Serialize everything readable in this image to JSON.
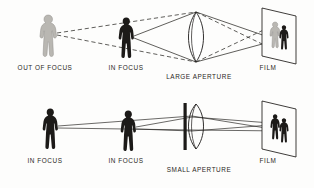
{
  "figure": {
    "background_color": "#fdfdfc",
    "ink_color": "#1c1a18",
    "blur_color": "#b9b7b2"
  },
  "panels": [
    {
      "id": "large-aperture",
      "aperture_type": "large",
      "subject_labels": [
        {
          "id": "out-of-focus",
          "text": "OUT OF FOCUS",
          "x": 45,
          "y": 70
        },
        {
          "id": "in-focus",
          "text": "IN FOCUS",
          "x": 126,
          "y": 70
        }
      ],
      "aperture_label": {
        "id": "large-aperture",
        "text": "LARGE APERTURE",
        "x": 199,
        "y": 79
      },
      "film_label": {
        "id": "film",
        "text": "FILM",
        "x": 268,
        "y": 70
      },
      "subjects": [
        {
          "id": "subject-out-of-focus",
          "state": "blurred",
          "color": "#b9b7b2",
          "x": 48,
          "y": 36
        },
        {
          "id": "subject-in-focus",
          "state": "sharp",
          "color": "#1c1a18",
          "x": 126,
          "y": 36
        }
      ],
      "film_image": [
        {
          "id": "film-figure-blurred",
          "state": "blurred",
          "color": "#b9b7b2"
        },
        {
          "id": "film-figure-sharp",
          "state": "sharp",
          "color": "#1c1a18"
        }
      ],
      "ray_styles": {
        "out_of_focus": "dashed",
        "in_focus": "solid"
      }
    },
    {
      "id": "small-aperture",
      "aperture_type": "small",
      "subject_labels": [
        {
          "id": "in-focus-near",
          "text": "IN FOCUS",
          "x": 45,
          "y": 163
        },
        {
          "id": "in-focus-far",
          "text": "IN FOCUS",
          "x": 126,
          "y": 163
        }
      ],
      "aperture_label": {
        "id": "small-aperture",
        "text": "SMALL APERTURE",
        "x": 199,
        "y": 172
      },
      "film_label": {
        "id": "film",
        "text": "FILM",
        "x": 268,
        "y": 163
      },
      "subjects": [
        {
          "id": "subject-in-focus-near",
          "state": "sharp",
          "color": "#1c1a18",
          "x": 48,
          "y": 129
        },
        {
          "id": "subject-in-focus-far",
          "state": "sharp",
          "color": "#1c1a18",
          "x": 126,
          "y": 129
        }
      ],
      "film_image": [
        {
          "id": "film-figure-sharp-a",
          "state": "sharp",
          "color": "#1c1a18"
        },
        {
          "id": "film-figure-sharp-b",
          "state": "sharp",
          "color": "#1c1a18"
        }
      ],
      "ray_styles": {
        "near": "solid",
        "far": "solid"
      }
    }
  ]
}
